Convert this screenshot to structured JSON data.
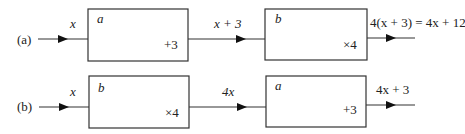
{
  "rows": [
    {
      "label": "(a)",
      "input": "x",
      "box1": {
        "name": "a",
        "op": "+3"
      },
      "middle": "x + 3",
      "box2": {
        "name": "b",
        "op": "×4"
      },
      "output": "4(x + 3) = 4x + 12"
    },
    {
      "label": "(b)",
      "input": "x",
      "box1": {
        "name": "b",
        "op": "×4"
      },
      "middle": "4x",
      "box2": {
        "name": "a",
        "op": "+3"
      },
      "output": "4x + 3"
    }
  ],
  "colors": {
    "stroke": "#333333",
    "text": "#222222",
    "background": "#ffffff"
  }
}
